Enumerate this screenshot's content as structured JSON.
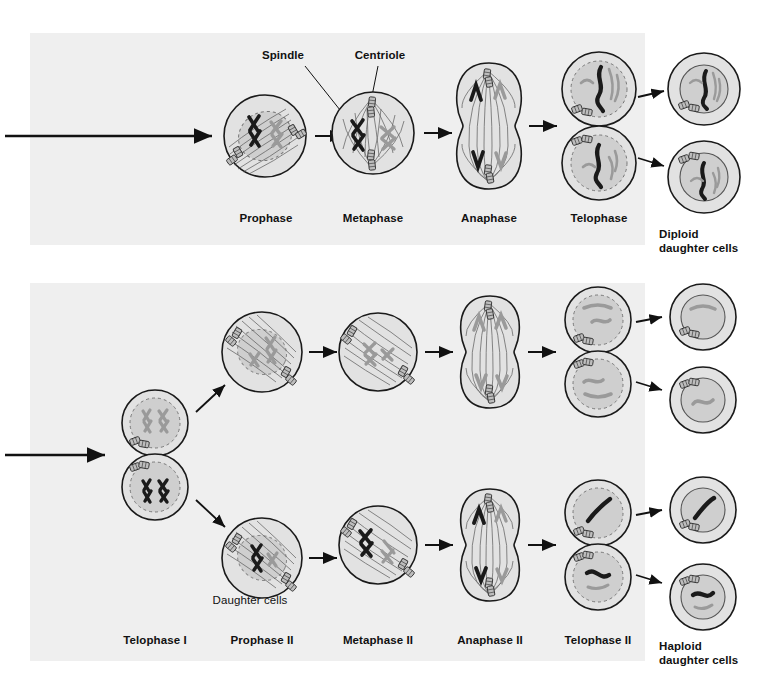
{
  "figure": {
    "title_present": false,
    "panels": [
      {
        "id": "mitosis",
        "phases": [
          "Prophase",
          "Metaphase",
          "Anaphase",
          "Telophase"
        ],
        "callouts": [
          "Spindle",
          "Centriole"
        ],
        "outcome_label": "Diploid\ndaughter cells",
        "outcome_line1": "Diploid",
        "outcome_line2": "daughter cells",
        "outcome_cell_count": 2
      },
      {
        "id": "meiosis-ii",
        "phases": [
          "Telophase I",
          "Prophase II",
          "Metaphase II",
          "Anaphase II",
          "Telophase II"
        ],
        "interior_label": "Daughter cells",
        "outcome_label": "Haploid\ndaughter cells",
        "outcome_line1": "Haploid",
        "outcome_line2": "daughter cells",
        "outcome_cell_count": 4
      }
    ]
  },
  "colors": {
    "panel_background": "#efefef",
    "page_background": "#ffffff",
    "outline": "#1a1a1a",
    "cytoplasm": "#e2e2e2",
    "nucleus_fill": "#cfcfcf",
    "chromosome_dark": "#1a1a1a",
    "chromosome_light": "#9a9a9a",
    "spindle_fiber": "#555555",
    "centriole_fill": "#bdbdbd",
    "text": "#111111"
  },
  "labels": {
    "spindle": "Spindle",
    "centriole": "Centriole",
    "prophase": "Prophase",
    "metaphase": "Metaphase",
    "anaphase": "Anaphase",
    "telophase": "Telophase",
    "diploid_l1": "Diploid",
    "diploid_l2": "daughter cells",
    "telophase_1": "Telophase I",
    "prophase_2": "Prophase II",
    "metaphase_2": "Metaphase II",
    "anaphase_2": "Anaphase II",
    "telophase_2": "Telophase II",
    "daughter_cells": "Daughter cells",
    "haploid_l1": "Haploid",
    "haploid_l2": "daughter cells"
  }
}
